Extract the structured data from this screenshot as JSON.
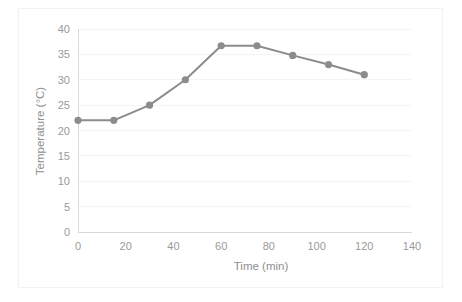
{
  "chart_data": {
    "type": "line",
    "title": "",
    "subtitle": "",
    "xlabel": "Time (min)",
    "ylabel": "Temperature (°C)",
    "xlim": [
      0,
      140
    ],
    "ylim": [
      0,
      40
    ],
    "x_ticks": [
      0,
      20,
      40,
      60,
      80,
      100,
      120,
      140
    ],
    "y_ticks": [
      0,
      5,
      10,
      15,
      20,
      25,
      30,
      35,
      40
    ],
    "x_tick_labels": [
      "0",
      "20",
      "40",
      "60",
      "80",
      "100",
      "120",
      "140"
    ],
    "y_tick_labels": [
      "0",
      "5",
      "10",
      "15",
      "20",
      "25",
      "30",
      "35",
      "40"
    ],
    "grid": "horizontal",
    "legend": "none",
    "series": [
      {
        "name": "Temperature",
        "color": "#8c8c8c",
        "marker": "circle",
        "x": [
          0,
          15,
          30,
          45,
          60,
          75,
          90,
          105,
          120
        ],
        "values": [
          22,
          22,
          25,
          30,
          36.7,
          36.7,
          34.8,
          33,
          31
        ]
      }
    ]
  },
  "axes": {
    "x_title": "Time (min)",
    "y_title": "Temperature (°C)"
  },
  "style": {
    "series_color": "#8c8c8c",
    "grid_color": "#f4f4f4",
    "axis_color": "#d9d9d9",
    "text_color": "#9a9a9a",
    "frame_color": "#f2f2f2",
    "background": "#ffffff"
  }
}
